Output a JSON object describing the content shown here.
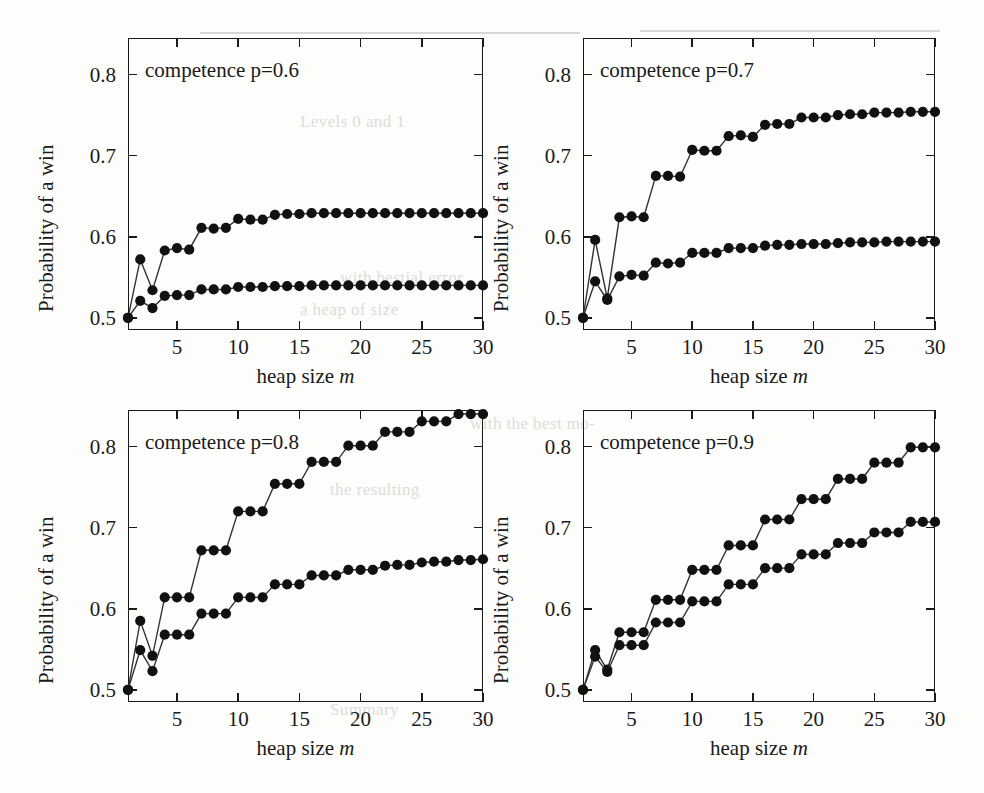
{
  "figure": {
    "shared": {
      "xlabel": "heap size ",
      "xlabel_italic": "m",
      "ylabel": "Probability of a win",
      "x_ticks": [
        5,
        10,
        15,
        20,
        25,
        30
      ],
      "y_ticks": [
        0.5,
        0.6,
        0.7,
        0.8
      ],
      "y_tick_labels": [
        "0.5",
        "0.6",
        "0.7",
        "0.8"
      ],
      "x_tick_labels": [
        "5",
        "10",
        "15",
        "20",
        "25",
        "30"
      ]
    },
    "background_bleed": [
      {
        "text": "Levels 0 and 1",
        "x": 300,
        "y": 112
      },
      {
        "text": "with  bestial  error",
        "x": 340,
        "y": 268
      },
      {
        "text": "a  heap  of  size",
        "x": 300,
        "y": 300
      },
      {
        "text": "with  the  best  mo-",
        "x": 470,
        "y": 414
      },
      {
        "text": "the  resulting",
        "x": 330,
        "y": 480
      },
      {
        "text": "Summary",
        "x": 330,
        "y": 700
      }
    ]
  },
  "chart_data": [
    {
      "type": "line",
      "title": "competence p=0.6",
      "xlabel": "heap size m",
      "ylabel": "Probability of a win",
      "xlim": [
        1,
        30
      ],
      "ylim": [
        0.485,
        0.845
      ],
      "grid": false,
      "legend": "none",
      "x": [
        1,
        2,
        3,
        4,
        5,
        6,
        7,
        8,
        9,
        10,
        11,
        12,
        13,
        14,
        15,
        16,
        17,
        18,
        19,
        20,
        21,
        22,
        23,
        24,
        25,
        26,
        27,
        28,
        29,
        30
      ],
      "series": [
        {
          "name": "upper",
          "values": [
            0.5,
            0.572,
            0.534,
            0.583,
            0.586,
            0.584,
            0.611,
            0.61,
            0.611,
            0.622,
            0.621,
            0.621,
            0.627,
            0.628,
            0.628,
            0.629,
            0.629,
            0.629,
            0.629,
            0.629,
            0.629,
            0.629,
            0.629,
            0.629,
            0.629,
            0.629,
            0.629,
            0.629,
            0.629,
            0.629
          ]
        },
        {
          "name": "lower",
          "values": [
            0.5,
            0.521,
            0.512,
            0.527,
            0.528,
            0.528,
            0.535,
            0.535,
            0.535,
            0.538,
            0.538,
            0.538,
            0.539,
            0.539,
            0.539,
            0.54,
            0.54,
            0.54,
            0.54,
            0.54,
            0.54,
            0.54,
            0.54,
            0.54,
            0.54,
            0.54,
            0.54,
            0.54,
            0.54,
            0.54
          ]
        }
      ]
    },
    {
      "type": "line",
      "title": "competence p=0.7",
      "xlabel": "heap size m",
      "ylabel": "Probability of a win",
      "xlim": [
        1,
        30
      ],
      "ylim": [
        0.485,
        0.845
      ],
      "grid": false,
      "legend": "none",
      "x": [
        1,
        2,
        3,
        4,
        5,
        6,
        7,
        8,
        9,
        10,
        11,
        12,
        13,
        14,
        15,
        16,
        17,
        18,
        19,
        20,
        21,
        22,
        23,
        24,
        25,
        26,
        27,
        28,
        29,
        30
      ],
      "series": [
        {
          "name": "upper",
          "values": [
            0.5,
            0.596,
            0.524,
            0.624,
            0.625,
            0.624,
            0.675,
            0.675,
            0.674,
            0.707,
            0.706,
            0.706,
            0.724,
            0.725,
            0.723,
            0.738,
            0.739,
            0.739,
            0.747,
            0.747,
            0.747,
            0.75,
            0.751,
            0.751,
            0.753,
            0.753,
            0.753,
            0.754,
            0.754,
            0.754
          ]
        },
        {
          "name": "lower",
          "values": [
            0.5,
            0.545,
            0.522,
            0.551,
            0.553,
            0.552,
            0.568,
            0.567,
            0.568,
            0.58,
            0.58,
            0.58,
            0.586,
            0.586,
            0.586,
            0.589,
            0.59,
            0.59,
            0.591,
            0.591,
            0.591,
            0.592,
            0.593,
            0.593,
            0.593,
            0.594,
            0.594,
            0.594,
            0.594,
            0.594
          ]
        }
      ]
    },
    {
      "type": "line",
      "title": "competence p=0.8",
      "xlabel": "heap size m",
      "ylabel": "Probability of a win",
      "xlim": [
        1,
        30
      ],
      "ylim": [
        0.485,
        0.845
      ],
      "grid": false,
      "legend": "none",
      "x": [
        1,
        2,
        3,
        4,
        5,
        6,
        7,
        8,
        9,
        10,
        11,
        12,
        13,
        14,
        15,
        16,
        17,
        18,
        19,
        20,
        21,
        22,
        23,
        24,
        25,
        26,
        27,
        28,
        29,
        30
      ],
      "series": [
        {
          "name": "upper",
          "values": [
            0.5,
            0.585,
            0.542,
            0.614,
            0.614,
            0.614,
            0.672,
            0.672,
            0.672,
            0.72,
            0.72,
            0.72,
            0.754,
            0.754,
            0.754,
            0.781,
            0.781,
            0.781,
            0.801,
            0.801,
            0.801,
            0.818,
            0.818,
            0.818,
            0.831,
            0.831,
            0.831,
            0.84,
            0.84,
            0.84
          ]
        },
        {
          "name": "lower",
          "values": [
            0.5,
            0.549,
            0.523,
            0.568,
            0.568,
            0.568,
            0.594,
            0.594,
            0.594,
            0.614,
            0.614,
            0.614,
            0.63,
            0.63,
            0.63,
            0.641,
            0.641,
            0.641,
            0.648,
            0.648,
            0.648,
            0.653,
            0.654,
            0.654,
            0.657,
            0.658,
            0.658,
            0.66,
            0.66,
            0.661
          ]
        }
      ]
    },
    {
      "type": "line",
      "title": "competence p=0.9",
      "xlabel": "heap size m",
      "ylabel": "Probability of a win",
      "xlim": [
        1,
        30
      ],
      "ylim": [
        0.485,
        0.845
      ],
      "grid": false,
      "legend": "none",
      "x": [
        1,
        2,
        3,
        4,
        5,
        6,
        7,
        8,
        9,
        10,
        11,
        12,
        13,
        14,
        15,
        16,
        17,
        18,
        19,
        20,
        21,
        22,
        23,
        24,
        25,
        26,
        27,
        28,
        29,
        30
      ],
      "series": [
        {
          "name": "upper",
          "values": [
            0.5,
            0.549,
            0.525,
            0.571,
            0.571,
            0.571,
            0.611,
            0.611,
            0.611,
            0.648,
            0.648,
            0.648,
            0.678,
            0.678,
            0.678,
            0.71,
            0.71,
            0.71,
            0.735,
            0.735,
            0.735,
            0.76,
            0.76,
            0.76,
            0.78,
            0.78,
            0.78,
            0.799,
            0.799,
            0.799
          ]
        },
        {
          "name": "lower",
          "values": [
            0.5,
            0.541,
            0.522,
            0.555,
            0.555,
            0.555,
            0.583,
            0.583,
            0.583,
            0.609,
            0.609,
            0.609,
            0.63,
            0.63,
            0.63,
            0.65,
            0.65,
            0.65,
            0.667,
            0.667,
            0.667,
            0.681,
            0.681,
            0.681,
            0.694,
            0.694,
            0.694,
            0.707,
            0.707,
            0.707
          ]
        }
      ]
    }
  ],
  "panels": [
    {
      "id": "p06",
      "note": "competence p=0.6",
      "xlabel": "heap size ",
      "xlabel_italic": "m",
      "ylabel": "Probability of a win"
    },
    {
      "id": "p07",
      "note": "competence p=0.7",
      "xlabel": "heap size ",
      "xlabel_italic": "m",
      "ylabel": "Probability of a win"
    },
    {
      "id": "p08",
      "note": "competence p=0.8",
      "xlabel": "heap size ",
      "xlabel_italic": "m",
      "ylabel": "Probability of a win"
    },
    {
      "id": "p09",
      "note": "competence p=0.9",
      "xlabel": "heap size ",
      "xlabel_italic": "m",
      "ylabel": "Probability of a win"
    }
  ],
  "style": {
    "marker_color": "#111111",
    "line_color": "#333333",
    "axis_color": "#1a1a1a",
    "background": "#fdfdfc"
  }
}
